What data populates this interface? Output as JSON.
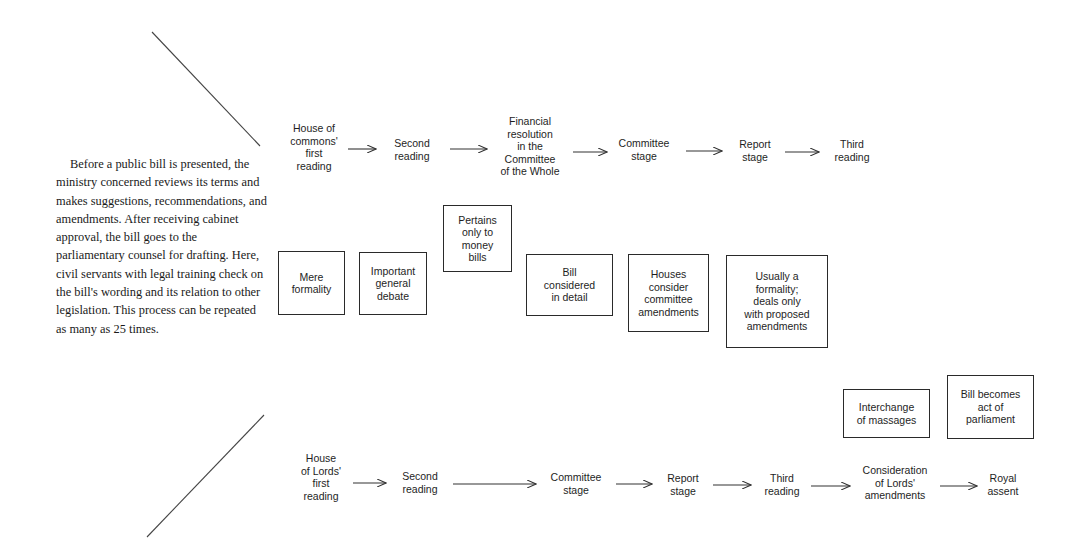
{
  "intro_text": "Before a public bill is presented, the ministry concerned reviews its terms and makes suggestions, recommendations, and amendments. After receiving cabinet approval, the bill goes to the parliamentary counsel for drafting. Here, civil servants with legal training check on the bill's wording and its relation to other legislation. This process can be repeated as many as 25 times.",
  "commons": {
    "steps": [
      "House of\ncommons'\nfirst\nreading",
      "Second\nreading",
      "Financial\nresolution\nin the\nCommittee\nof the Whole",
      "Committee\nstage",
      "Report\nstage",
      "Third\nreading"
    ]
  },
  "notes": [
    "Mere\nformality",
    "Important\ngeneral\ndebate",
    "Pertains\nonly to\nmoney\nbills",
    "Bill\nconsidered\nin detail",
    "Houses\nconsider\ncommittee\namendments",
    "Usually a\nformality;\ndeals only\nwith proposed\namendments",
    "Interchange\nof massages",
    "Bill becomes\nact of\nparliament"
  ],
  "lords": {
    "steps": [
      "House\nof Lords'\nfirst\nreading",
      "Second\nreading",
      "Committee\nstage",
      "Report\nstage",
      "Third\nreading",
      "Consideration\nof Lords'\namendments",
      "Royal\nassent"
    ]
  },
  "colors": {
    "line": "#333333",
    "text": "#1e1e1e",
    "background": "#ffffff"
  }
}
